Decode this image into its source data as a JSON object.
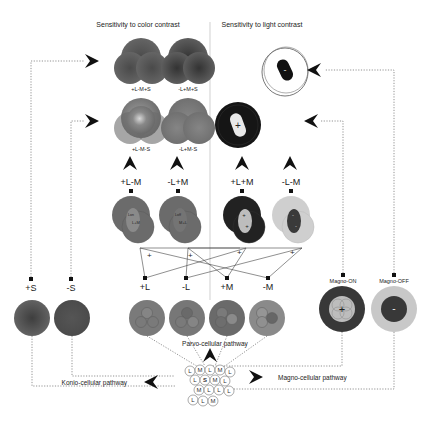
{
  "headings": {
    "color": "Sensitivity to color contrast",
    "light": "Sensitivity to light contrast"
  },
  "color_outputs": [
    {
      "label": "+L-M+S"
    },
    {
      "label": "-L+M+S"
    },
    {
      "label": "+L-M-S"
    },
    {
      "label": "-L+M-S"
    }
  ],
  "opponent_cells": [
    {
      "label": "+L-M",
      "inner_top": "Lon",
      "inner_bottom": "L+M"
    },
    {
      "label": "-L+M",
      "inner_top": "Loff",
      "inner_bottom": "M+L"
    },
    {
      "label": "+L+M",
      "center_sign": "+"
    },
    {
      "label": "-L-M",
      "center_sign": "-"
    }
  ],
  "light_outputs": [
    {
      "sign": "+"
    },
    {
      "sign": "-"
    }
  ],
  "cross_signs": [
    "+",
    "+",
    "+",
    "+"
  ],
  "parvo_cells": [
    {
      "label": "+L"
    },
    {
      "label": "-L"
    },
    {
      "label": "+M"
    },
    {
      "label": "-M"
    }
  ],
  "konio_cells": [
    {
      "label": "+S"
    },
    {
      "label": "-S"
    }
  ],
  "magno_cells": [
    {
      "label": "Magno-ON",
      "sign": "+"
    },
    {
      "label": "Magno-OFF",
      "sign": "-"
    }
  ],
  "pathways": {
    "parvo": "Parvo-cellular pathway",
    "konio": "Konio-cellular pathway",
    "magno": "Magno-cellular pathway"
  },
  "cones": {
    "rows": [
      [
        "L",
        "M",
        "L",
        "M",
        "L"
      ],
      [
        "L",
        "S",
        "M",
        "L"
      ],
      [
        "M",
        "L",
        "L",
        "L"
      ],
      [
        "L",
        "L",
        "M"
      ]
    ]
  },
  "colors": {
    "gray_dark": "#555555",
    "gray_mid": "#6e6e6e",
    "gray_light": "#c8c8c8",
    "black": "#1a1a1a"
  }
}
